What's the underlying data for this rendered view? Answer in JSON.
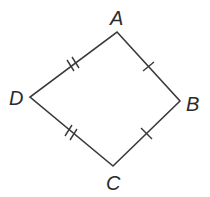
{
  "diagram": {
    "type": "kite",
    "vertices": [
      {
        "name": "A",
        "x": 117,
        "y": 32
      },
      {
        "name": "B",
        "x": 180,
        "y": 101
      },
      {
        "name": "C",
        "x": 113,
        "y": 166
      },
      {
        "name": "D",
        "x": 30,
        "y": 97
      }
    ],
    "labels": {
      "A": "A",
      "B": "B",
      "C": "C",
      "D": "D"
    },
    "congruence_marks": [
      {
        "segment": "AB",
        "ticks": 1
      },
      {
        "segment": "BC",
        "ticks": 1
      },
      {
        "segment": "AD",
        "ticks": 2
      },
      {
        "segment": "DC",
        "ticks": 2
      }
    ],
    "colors": {
      "line": "#3a3a3a",
      "text": "#2b2b2b",
      "background": "#ffffff"
    }
  }
}
